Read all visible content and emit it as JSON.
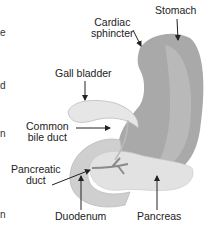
{
  "labels": {
    "stomach": "Stomach",
    "cardiac_1": "Cardiac",
    "cardiac_2": "sphincter",
    "gall_bladder": "Gall bladder",
    "common_1": "Common",
    "common_2": "bile duct",
    "pancreatic_1": "Pancreatic",
    "pancreatic_2": "duct",
    "duodenum": "Duodenum",
    "pancreas": "Pancreas"
  },
  "edge_fragments": [
    "e",
    "d",
    "n",
    "P",
    "n"
  ],
  "colors": {
    "stomach": "#a9a9a9",
    "stomach_light": "#bdbdbd",
    "gall_bladder": "#e6e6e6",
    "duodenum": "#cfcfcf",
    "pancreas": "#e2e2e2",
    "duct": "#8a8a8a",
    "arrow": "#222222"
  }
}
